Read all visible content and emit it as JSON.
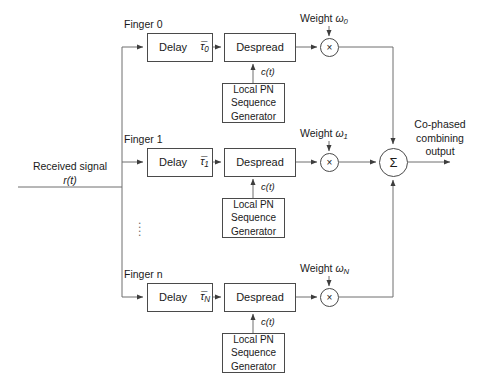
{
  "diagram": {
    "input": {
      "line1": "Received signal",
      "line2": "r(t)"
    },
    "output": {
      "line1": "Co-phased",
      "line2": "combining",
      "line3": "output"
    },
    "summer_symbol": "Σ",
    "multiplier_symbol": "×",
    "ellipsis_marker": "⋮",
    "code_signal_label": "c(t)",
    "pn_block": {
      "line1": "Local PN",
      "line2": "Sequence",
      "line3": "Generator"
    },
    "despread_label": "Despread",
    "delay_label": "Delay",
    "weight_prefix": "Weight",
    "fingers": [
      {
        "name": "Finger 0",
        "delay_label": "Delay",
        "delay_symbol": "τ̅0",
        "delay_symbol_base": "τ̅",
        "delay_symbol_sub": "0",
        "despread_label": "Despread",
        "code_label": "c(t)",
        "weight_label": "Weight",
        "weight_symbol_base": "ω",
        "weight_symbol_sub": "0",
        "pn_line1": "Local PN",
        "pn_line2": "Sequence",
        "pn_line3": "Generator"
      },
      {
        "name": "Finger 1",
        "delay_label": "Delay",
        "delay_symbol": "τ̅1",
        "delay_symbol_base": "τ̅",
        "delay_symbol_sub": "1",
        "despread_label": "Despread",
        "code_label": "c(t)",
        "weight_label": "Weight",
        "weight_symbol_base": "ω",
        "weight_symbol_sub": "1",
        "pn_line1": "Local PN",
        "pn_line2": "Sequence",
        "pn_line3": "Generator"
      },
      {
        "name": "Finger n",
        "delay_label": "Delay",
        "delay_symbol": "τ̅N",
        "delay_symbol_base": "τ̅",
        "delay_symbol_sub": "N",
        "despread_label": "Despread",
        "code_label": "c(t)",
        "weight_label": "Weight",
        "weight_symbol_base": "ω",
        "weight_symbol_sub": "N",
        "pn_line1": "Local PN",
        "pn_line2": "Sequence",
        "pn_line3": "Generator"
      }
    ],
    "colors": {
      "stroke": "#4a4a4a",
      "text": "#1a1a1a",
      "background": "#ffffff",
      "dots": "#6d6d6d"
    }
  }
}
